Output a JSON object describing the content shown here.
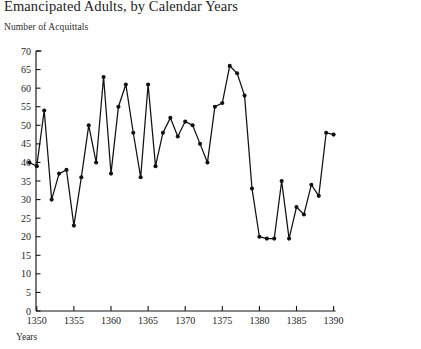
{
  "chart_data": {
    "type": "line",
    "title": "Emancipated Adults, by Calendar Years",
    "ylabel": "Number of Acquittals",
    "xlabel": "Years",
    "ylim": [
      0,
      70
    ],
    "xlim": [
      1349,
      1390
    ],
    "grid": false,
    "legend": null,
    "y_ticks": [
      0,
      5,
      10,
      15,
      20,
      25,
      30,
      35,
      40,
      45,
      50,
      55,
      60,
      65,
      70
    ],
    "y_tick_labels": [
      "0",
      "5",
      "10",
      "15",
      "20",
      "25",
      "30",
      "35",
      "40",
      "45",
      "50",
      "55",
      "60",
      "65",
      "70"
    ],
    "x_ticks": [
      1350,
      1355,
      1360,
      1365,
      1370,
      1375,
      1380,
      1385,
      1390
    ],
    "x_tick_labels": [
      "1350",
      "1355",
      "1360",
      "1365",
      "1370",
      "1375",
      "1380",
      "1385",
      "1390"
    ],
    "markers": "filled-circle",
    "x": [
      1349,
      1350,
      1351,
      1352,
      1353,
      1354,
      1355,
      1356,
      1357,
      1358,
      1359,
      1360,
      1361,
      1362,
      1363,
      1364,
      1365,
      1366,
      1367,
      1368,
      1369,
      1370,
      1371,
      1372,
      1373,
      1374,
      1375,
      1376,
      1377,
      1378,
      1379,
      1380,
      1381,
      1382,
      1383,
      1384,
      1385,
      1386,
      1387,
      1388,
      1389,
      1390
    ],
    "values": [
      40,
      39,
      54,
      30,
      37,
      38,
      23,
      36,
      50,
      40,
      63,
      37,
      55,
      61,
      48,
      36,
      61,
      39,
      48,
      52,
      47,
      51,
      50,
      45,
      40,
      55,
      56,
      66,
      64,
      58,
      33,
      20,
      19.5,
      19.5,
      35,
      19.5,
      28,
      26,
      34,
      31,
      48,
      47.5
    ],
    "series": [
      {
        "name": "Number of Acquittals",
        "values": [
          40,
          39,
          54,
          30,
          37,
          38,
          23,
          36,
          50,
          40,
          63,
          37,
          55,
          61,
          48,
          36,
          61,
          39,
          48,
          52,
          47,
          51,
          50,
          45,
          40,
          55,
          56,
          66,
          64,
          58,
          33,
          20,
          19.5,
          19.5,
          35,
          19.5,
          28,
          26,
          34,
          31,
          48,
          47.5
        ]
      }
    ],
    "annotations": []
  },
  "caption": {
    "ghost_text": ""
  }
}
